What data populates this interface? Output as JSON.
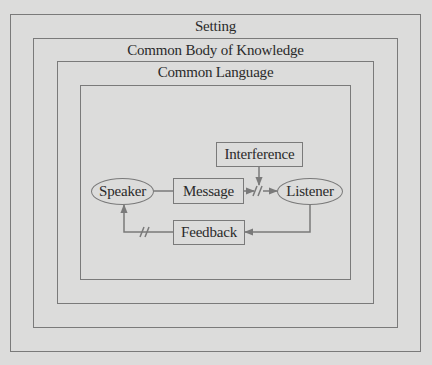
{
  "frames": {
    "setting": "Setting",
    "knowledge": "Common Body of Knowledge",
    "language": "Common Language"
  },
  "nodes": {
    "speaker": "Speaker",
    "message": "Message",
    "listener": "Listener",
    "interference": "Interference",
    "feedback": "Feedback"
  },
  "colors": {
    "background": "#dcdcdb",
    "line": "#7a7a7a",
    "text": "#2a2a2a"
  }
}
